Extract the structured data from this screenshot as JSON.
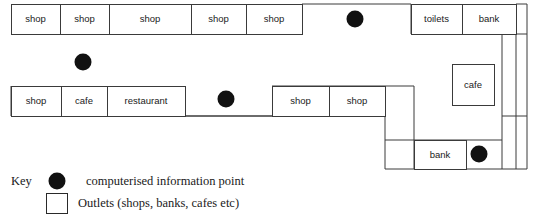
{
  "plan": {
    "title": "Shopping centre floor plan",
    "units": [
      {
        "id": "u1",
        "label": "shop",
        "x": 11,
        "y": 4,
        "w": 49,
        "h": 30
      },
      {
        "id": "u2",
        "label": "shop",
        "x": 60,
        "y": 4,
        "w": 49,
        "h": 30
      },
      {
        "id": "u3",
        "label": "shop",
        "x": 109,
        "y": 4,
        "w": 82,
        "h": 30
      },
      {
        "id": "u4",
        "label": "shop",
        "x": 191,
        "y": 4,
        "w": 55,
        "h": 30
      },
      {
        "id": "u5",
        "label": "shop",
        "x": 246,
        "y": 4,
        "w": 56,
        "h": 30
      },
      {
        "id": "u6",
        "label": "toilets",
        "x": 411,
        "y": 4,
        "w": 51,
        "h": 30
      },
      {
        "id": "u7",
        "label": "bank",
        "x": 462,
        "y": 4,
        "w": 54,
        "h": 30
      },
      {
        "id": "u8",
        "label": "shop",
        "x": 11,
        "y": 86,
        "w": 50,
        "h": 30
      },
      {
        "id": "u9",
        "label": "cafe",
        "x": 61,
        "y": 86,
        "w": 46,
        "h": 30
      },
      {
        "id": "u10",
        "label": "restaurant",
        "x": 107,
        "y": 86,
        "w": 78,
        "h": 30
      },
      {
        "id": "u11",
        "label": "shop",
        "x": 272,
        "y": 86,
        "w": 57,
        "h": 30
      },
      {
        "id": "u12",
        "label": "shop",
        "x": 329,
        "y": 86,
        "w": 56,
        "h": 30
      },
      {
        "id": "u13",
        "label": "cafe",
        "x": 452,
        "y": 64,
        "w": 42,
        "h": 41
      },
      {
        "id": "u14",
        "label": "bank",
        "x": 414,
        "y": 140,
        "w": 52,
        "h": 29
      }
    ],
    "info_points": [
      {
        "id": "dot-top-centre",
        "cx": 355,
        "cy": 19,
        "r": 8.5
      },
      {
        "id": "dot-upper-left",
        "cx": 83,
        "cy": 62,
        "r": 8.5
      },
      {
        "id": "dot-mid-centre",
        "cx": 226,
        "cy": 99,
        "r": 8.5
      },
      {
        "id": "dot-lower-right",
        "cx": 479,
        "cy": 154,
        "r": 8.5
      }
    ],
    "walls": [
      "M 302 4 L 411 4",
      "M 302 34 L 302 4",
      "M 411 34 L 411 4",
      "M 516 4 L 527 4 L 527 169 L 385 169 L 385 116 L 272 116 L 11 116",
      "M 516 4 L 516 34 L 516 169",
      "M 502 34 L 502 169",
      "M 502 34 L 527 34",
      "M 502 116 L 527 116",
      "M 385 140 L 502 140",
      "M 385 116 L 385 86 L 272 86",
      "M 385 86 L 414 86",
      "M 414 86 L 414 169",
      "M 11 86 L 11 116",
      "M 185 116 L 272 116"
    ]
  },
  "key": {
    "heading": "Key",
    "entries": [
      {
        "id": "key-info-point",
        "symbol": "dot",
        "text": "computerised information point"
      },
      {
        "id": "key-outlet",
        "symbol": "square",
        "text": "Outlets (shops, banks, cafes etc)"
      }
    ]
  },
  "colors": {
    "stroke": "#3a3a3a",
    "dot": "#111111",
    "text": "#1a1a1a",
    "background": "#ffffff"
  }
}
